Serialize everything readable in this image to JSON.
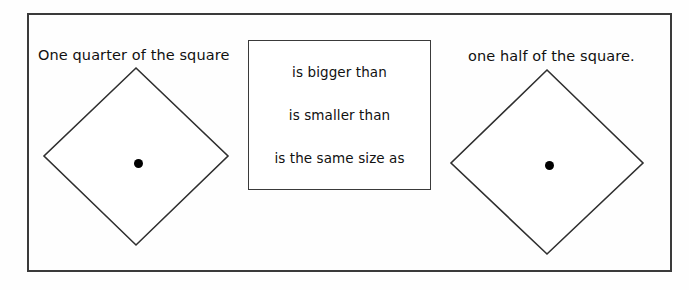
{
  "worksheet": {
    "background_color": "#fefefe",
    "frame_color": "#3a3a3a",
    "ink_color": "#111111"
  },
  "statement": {
    "left_label": "One quarter of the square",
    "right_label": "one half of the square."
  },
  "options": {
    "items": [
      {
        "label": "is bigger than"
      },
      {
        "label": "is smaller than"
      },
      {
        "label": "is the same size as"
      }
    ]
  },
  "shapes": {
    "left_diamond": {
      "name": "rotated-square-one-quarter",
      "center_dot": true,
      "width": 187,
      "height": 180
    },
    "right_diamond": {
      "name": "rotated-square-one-half",
      "center_dot": true,
      "width": 193,
      "height": 186
    }
  }
}
